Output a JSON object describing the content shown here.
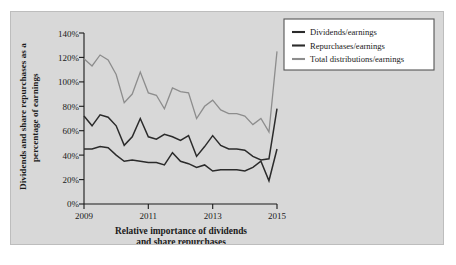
{
  "figure": {
    "background_color": "#d8d8d8",
    "border_color": "#bdbdbd",
    "page_background": "#ffffff"
  },
  "legend": {
    "position": "top-right",
    "box_fill": "#ffffff",
    "box_border": "#555555",
    "entries": [
      {
        "label": "Dividends/earnings",
        "color": "#2b2b2b"
      },
      {
        "label": "Repurchases/earnings",
        "color": "#2b2b2b"
      },
      {
        "label": "Total distributions/earnings",
        "color": "#8d8d8d"
      }
    ]
  },
  "axes": {
    "x_title_line1": "Relative importance of dividends",
    "x_title_line2": "and share repurchases",
    "y_title_line1": "Dividends and share repurchases as a",
    "y_title_line2": "percentage of earnings",
    "y_ticks": [
      "0%",
      "20%",
      "40%",
      "60%",
      "80%",
      "100%",
      "120%",
      "140%"
    ],
    "x_ticks": [
      "2009",
      "2011",
      "2013",
      "2015"
    ],
    "x_minor_ticks": [
      "2010",
      "2012",
      "2014"
    ],
    "axis_color": "#1a1a1a"
  },
  "chart_data": {
    "type": "line",
    "title": "",
    "subtitle": "",
    "xlabel": "Relative importance of dividends and share repurchases",
    "ylabel": "Dividends and share repurchases as a percentage of earnings",
    "xlim": [
      2009.0,
      2015.0
    ],
    "ylim": [
      0,
      140
    ],
    "ytick_values": [
      0,
      20,
      40,
      60,
      80,
      100,
      120,
      140
    ],
    "ytick_labels": [
      "0%",
      "20%",
      "40%",
      "60%",
      "80%",
      "100%",
      "120%",
      "140%"
    ],
    "xtick_values": [
      2009,
      2011,
      2013,
      2015
    ],
    "xtick_labels": [
      "2009",
      "2011",
      "2013",
      "2015"
    ],
    "xtick_minor_values": [
      2010,
      2012,
      2014
    ],
    "grid": false,
    "legend_position": "upper right",
    "x": [
      2009.0,
      2009.25,
      2009.5,
      2009.75,
      2010.0,
      2010.25,
      2010.5,
      2010.75,
      2011.0,
      2011.25,
      2011.5,
      2011.75,
      2012.0,
      2012.25,
      2012.5,
      2012.75,
      2013.0,
      2013.25,
      2013.5,
      2013.75,
      2014.0,
      2014.25,
      2014.5,
      2014.75,
      2015.0
    ],
    "series": [
      {
        "name": "Dividends/earnings",
        "color": "#2b2b2b",
        "values": [
          45,
          45,
          47,
          46,
          40,
          35,
          36,
          35,
          34,
          34,
          32,
          42,
          35,
          33,
          30,
          32,
          27,
          28,
          28,
          28,
          27,
          30,
          35,
          19,
          45
        ]
      },
      {
        "name": "Repurchases/earnings",
        "color": "#2b2b2b",
        "values": [
          72,
          64,
          73,
          71,
          64,
          48,
          55,
          70,
          55,
          53,
          57,
          55,
          52,
          56,
          39,
          47,
          56,
          48,
          45,
          45,
          44,
          39,
          36,
          37,
          78
        ]
      },
      {
        "name": "Total distributions/earnings",
        "color": "#8d8d8d",
        "values": [
          119,
          113,
          122,
          118,
          106,
          83,
          90,
          108,
          91,
          89,
          78,
          95,
          92,
          91,
          70,
          80,
          85,
          77,
          74,
          74,
          72,
          65,
          70,
          59,
          125
        ]
      }
    ]
  }
}
